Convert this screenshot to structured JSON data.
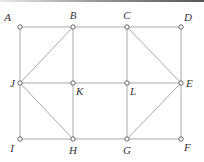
{
  "diagram": {
    "type": "graph",
    "nodes": [
      {
        "id": "A",
        "label": "A",
        "row": 0,
        "col": 0,
        "label_pos": "upper-left"
      },
      {
        "id": "B",
        "label": "B",
        "row": 0,
        "col": 1,
        "label_pos": "above"
      },
      {
        "id": "C",
        "label": "C",
        "row": 0,
        "col": 2,
        "label_pos": "above"
      },
      {
        "id": "D",
        "label": "D",
        "row": 0,
        "col": 3,
        "label_pos": "upper-right"
      },
      {
        "id": "J",
        "label": "J",
        "row": 1,
        "col": 0,
        "label_pos": "left"
      },
      {
        "id": "K",
        "label": "K",
        "row": 1,
        "col": 1,
        "label_pos": "lower-right"
      },
      {
        "id": "L",
        "label": "L",
        "row": 1,
        "col": 2,
        "label_pos": "lower-right"
      },
      {
        "id": "E",
        "label": "E",
        "row": 1,
        "col": 3,
        "label_pos": "right"
      },
      {
        "id": "I",
        "label": "I",
        "row": 2,
        "col": 0,
        "label_pos": "lower-left"
      },
      {
        "id": "H",
        "label": "H",
        "row": 2,
        "col": 1,
        "label_pos": "below"
      },
      {
        "id": "G",
        "label": "G",
        "row": 2,
        "col": 2,
        "label_pos": "below"
      },
      {
        "id": "F",
        "label": "F",
        "row": 2,
        "col": 3,
        "label_pos": "lower-right"
      }
    ],
    "edges": [
      [
        "A",
        "B"
      ],
      [
        "B",
        "C"
      ],
      [
        "C",
        "D"
      ],
      [
        "J",
        "K"
      ],
      [
        "K",
        "L"
      ],
      [
        "L",
        "E"
      ],
      [
        "I",
        "H"
      ],
      [
        "H",
        "G"
      ],
      [
        "G",
        "F"
      ],
      [
        "A",
        "J"
      ],
      [
        "J",
        "I"
      ],
      [
        "B",
        "K"
      ],
      [
        "K",
        "H"
      ],
      [
        "C",
        "L"
      ],
      [
        "L",
        "G"
      ],
      [
        "D",
        "E"
      ],
      [
        "E",
        "F"
      ],
      [
        "B",
        "J"
      ],
      [
        "J",
        "H"
      ],
      [
        "C",
        "E"
      ],
      [
        "E",
        "G"
      ]
    ]
  }
}
